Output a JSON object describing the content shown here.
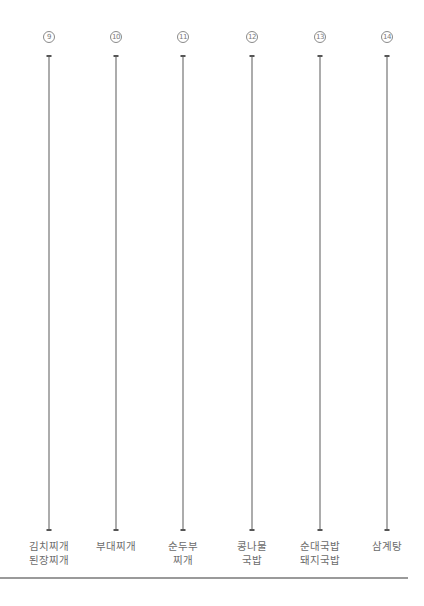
{
  "diagram": {
    "columns": [
      {
        "number": "9",
        "x": 49,
        "label_lines": [
          "김치찌개",
          "된장찌개"
        ]
      },
      {
        "number": "10",
        "x": 116,
        "label_lines": [
          "부대찌개"
        ]
      },
      {
        "number": "11",
        "x": 183,
        "label_lines": [
          "순두부",
          "찌개"
        ]
      },
      {
        "number": "12",
        "x": 252,
        "label_lines": [
          "콩나물",
          "국밥"
        ]
      },
      {
        "number": "13",
        "x": 320,
        "label_lines": [
          "순대국밥",
          "돼지국밥"
        ]
      },
      {
        "number": "14",
        "x": 387,
        "label_lines": [
          "삼계탕"
        ]
      }
    ],
    "colors": {
      "line": "#5a5a5a",
      "text": "#6b6b6b",
      "rule": "#9a9a9a"
    }
  }
}
